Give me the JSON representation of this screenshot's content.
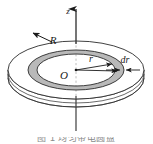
{
  "figure": {
    "background_color": "#ffffff",
    "line_color": "#2b2b2b",
    "ring_fill_color": "#b9b9b9",
    "disk_fill_color": "#ffffff",
    "axis": {
      "name": "z-axis",
      "label": "z",
      "label_x": 68,
      "label_y": 12,
      "solid_above_disk": true,
      "dashed_through_disk": true,
      "arrowhead": "up"
    },
    "labels": [
      {
        "id": "z",
        "text": "z",
        "x": 68,
        "y": 12,
        "font_size": 9,
        "italic": true
      },
      {
        "id": "R",
        "text": "R",
        "x": 53,
        "y": 41,
        "font_size": 11,
        "italic": true
      },
      {
        "id": "O",
        "text": "O",
        "x": 63,
        "y": 76,
        "font_size": 11,
        "italic": true
      },
      {
        "id": "r",
        "text": "r",
        "x": 88,
        "y": 61,
        "font_size": 10,
        "italic": true
      },
      {
        "id": "dr",
        "text": "dr",
        "x": 122,
        "y": 62,
        "font_size": 10,
        "italic": true
      }
    ],
    "leaders": [
      {
        "id": "R-leader",
        "from": "R label",
        "to": "outer disk rim",
        "direction": "up-left"
      },
      {
        "id": "r-leader",
        "from": "O center",
        "to": "inner ring edge",
        "direction": "right"
      },
      {
        "id": "rdr-leader",
        "from": "O center",
        "to": "outer ring edge",
        "direction": "right"
      },
      {
        "id": "dr-leader",
        "from": "dr label",
        "to": "ring band width",
        "direction": "left"
      }
    ],
    "geometry": {
      "center_x": 76,
      "center_y": 70,
      "outer_rx": 68,
      "outer_ry": 29,
      "ring_outer_rx": 48,
      "ring_outer_ry": 20,
      "ring_inner_rx": 39,
      "ring_inner_ry": 16,
      "disk_thickness_px": 14
    }
  },
  "caption": {
    "text": "图 1  均匀带电圆盘",
    "visible_fraction": "clipped at bottom edge"
  }
}
